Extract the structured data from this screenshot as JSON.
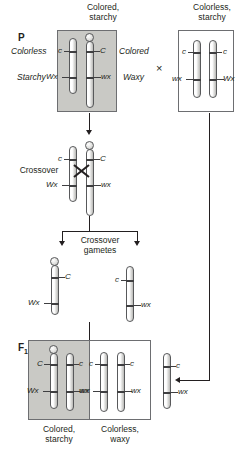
{
  "diagram": {
    "generations": {
      "p_label": "P",
      "f1_label": "F",
      "f1_sub": "1"
    },
    "cross_symbol": "×",
    "parents": [
      {
        "name": "parent-left",
        "caption": "Colored,\nstarchy",
        "side_labels": {
          "top": "Colorless",
          "bottom": "Starchy",
          "top_right": "Colored",
          "bottom_right": "Waxy"
        },
        "chromosomes": [
          {
            "name": "normal",
            "knob": false,
            "alleles": {
              "top": "c",
              "bottom": "Wx"
            }
          },
          {
            "name": "knobbed-translocated",
            "knob": true,
            "alleles": {
              "top": "C",
              "bottom": "wx"
            }
          }
        ]
      },
      {
        "name": "parent-right",
        "caption": "Colorless,\nstarchy",
        "chromosomes": [
          {
            "name": "normal-a",
            "knob": false,
            "alleles": {
              "top": "c",
              "bottom": "wx"
            }
          },
          {
            "name": "normal-b",
            "knob": false,
            "alleles": {
              "top": "c",
              "bottom": "Wx"
            }
          }
        ]
      }
    ],
    "crossover": {
      "label": "Crossover",
      "chromosomes": [
        {
          "name": "normal",
          "knob": false,
          "alleles": {
            "top": "c",
            "bottom": "Wx"
          }
        },
        {
          "name": "knobbed-translocated",
          "knob": true,
          "alleles": {
            "top": "C",
            "bottom": "wx"
          }
        }
      ]
    },
    "gametes": {
      "label": "Crossover\ngametes",
      "chromosomes": [
        {
          "name": "gamete-knobbed",
          "knob": true,
          "alleles": {
            "top": "C",
            "bottom": "Wx"
          }
        },
        {
          "name": "gamete-normal",
          "knob": false,
          "alleles": {
            "top": "c",
            "bottom": "wx"
          }
        }
      ]
    },
    "f1": {
      "offspring": [
        {
          "name": "offspring-colored-starchy",
          "caption": "Colored,\nstarchy",
          "shaded": true,
          "chromosomes": [
            {
              "name": "knobbed",
              "knob": true,
              "alleles": {
                "top": "C",
                "bottom": "Wx"
              }
            },
            {
              "name": "normal",
              "knob": false,
              "alleles": {
                "top": "c",
                "bottom": "wx"
              }
            }
          ]
        },
        {
          "name": "offspring-colorless-waxy",
          "caption": "Colorless,\nwaxy",
          "shaded": false,
          "chromosomes": [
            {
              "name": "normal-a",
              "knob": false,
              "alleles": {
                "top": "c",
                "bottom": "wx"
              }
            },
            {
              "name": "normal-b",
              "knob": false,
              "alleles": {
                "top": "c",
                "bottom": "wx"
              }
            }
          ]
        }
      ],
      "incoming_gamete": {
        "name": "testcross-gamete",
        "knob": false,
        "alleles": {
          "top": "c",
          "bottom": "wx"
        }
      }
    },
    "colors": {
      "shaded_box": "#c9c9c5",
      "box_border": "#6d6e71",
      "chromosome_outline": "#58595b",
      "band": "#3f3f41",
      "connector": "#231f20",
      "text": "#231f20"
    }
  }
}
